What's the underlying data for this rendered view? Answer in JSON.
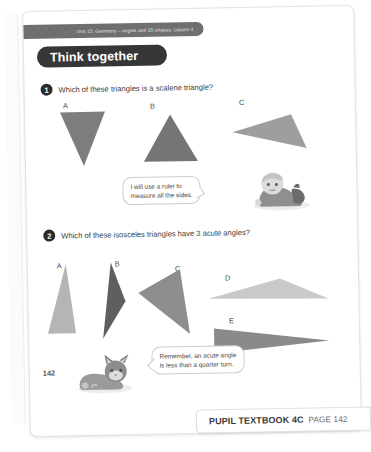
{
  "page": {
    "unit_header": "Unit 15: Geometry – angles and 2D shapes, Lesson 4",
    "section_banner": "Think together",
    "page_number": "142"
  },
  "questions": [
    {
      "number": "1",
      "text": "Which of these triangles is a scalene triangle?",
      "shapes": [
        {
          "label": "A",
          "fill": "#7d7d7d"
        },
        {
          "label": "B",
          "fill": "#757575"
        },
        {
          "label": "C",
          "fill": "#9e9e9e"
        }
      ]
    },
    {
      "number": "2",
      "text": "Which of these isosceles triangles have 3 acute angles?",
      "shapes": [
        {
          "label": "A",
          "fill": "#b5b5b5"
        },
        {
          "label": "B",
          "fill": "#5f5f5f"
        },
        {
          "label": "C",
          "fill": "#8e8e8e"
        },
        {
          "label": "D",
          "fill": "#c9c9c9"
        },
        {
          "label": "E",
          "fill": "#8a8a8a"
        }
      ]
    }
  ],
  "speech_bubbles": [
    {
      "line1": "I will use a ruler to",
      "line2": "measure all the sides.",
      "speaker": "child-character"
    },
    {
      "line1": "Remember, an acute angle",
      "line2": "is less than a quarter turn.",
      "speaker": "cat-character"
    }
  ],
  "bottom_banner": {
    "title": "PUPIL TEXTBOOK 4C",
    "page_label": "PAGE 142"
  },
  "colors": {
    "header_strip": "#6f6f6f",
    "banner_dark": "#363636",
    "page_background": "#ffffff",
    "text_primary": "#3a3a3a"
  }
}
